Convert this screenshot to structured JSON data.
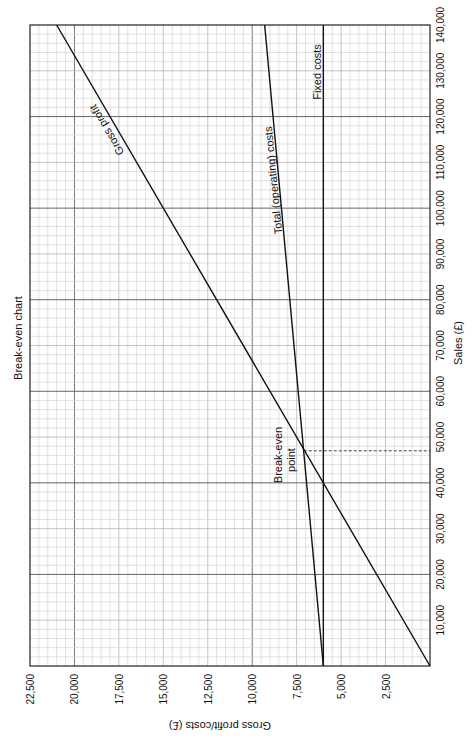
{
  "chart_data": {
    "type": "line",
    "title": "Break-even chart",
    "xlabel": "Sales (£)",
    "ylabel": "Gross profit/costs (£)",
    "orientation": "rotated 90° clockwise (sales axis vertical on right, cost axis horizontal at bottom, reading right-to-left)",
    "xlim": [
      0,
      140000
    ],
    "ylim": [
      0,
      22500
    ],
    "x_ticks": [
      10000,
      20000,
      30000,
      40000,
      50000,
      60000,
      70000,
      80000,
      90000,
      100000,
      110000,
      120000,
      130000,
      140000
    ],
    "x_tick_labels": [
      "10,000",
      "20,000",
      "30,000",
      "40,000",
      "50,000",
      "60,000",
      "70,000",
      "80,000",
      "90,000",
      "100,000",
      "110,000",
      "120,000",
      "130,000",
      "140,000"
    ],
    "y_ticks": [
      2500,
      5000,
      7500,
      10000,
      12500,
      15000,
      17500,
      20000,
      22500
    ],
    "y_tick_labels": [
      "2,500",
      "5,000",
      "7,500",
      "10,000",
      "12,500",
      "15,000",
      "17,500",
      "20,000",
      "22,500"
    ],
    "grid": true,
    "x": [
      0,
      140000
    ],
    "series": [
      {
        "name": "Gross profit",
        "values": [
          0,
          21000
        ]
      },
      {
        "name": "Total (operating) costs",
        "values": [
          6000,
          9300
        ]
      },
      {
        "name": "Fixed costs",
        "values": [
          6000,
          6000
        ]
      }
    ],
    "annotations": [
      {
        "text": "Break-even point",
        "x": 47000,
        "y": 7100,
        "marker": "dashed line to sales axis"
      }
    ],
    "legend": "inline labels on lines"
  },
  "labels": {
    "title": "Break-even chart",
    "xlabel": "Sales (£)",
    "ylabel": "Gross profit/costs (£)",
    "gross_profit": "Gross profit",
    "total_costs": "Total (operating) costs",
    "fixed_costs": "Fixed costs",
    "breakeven_line1": "Break-even",
    "breakeven_line2": "point"
  }
}
